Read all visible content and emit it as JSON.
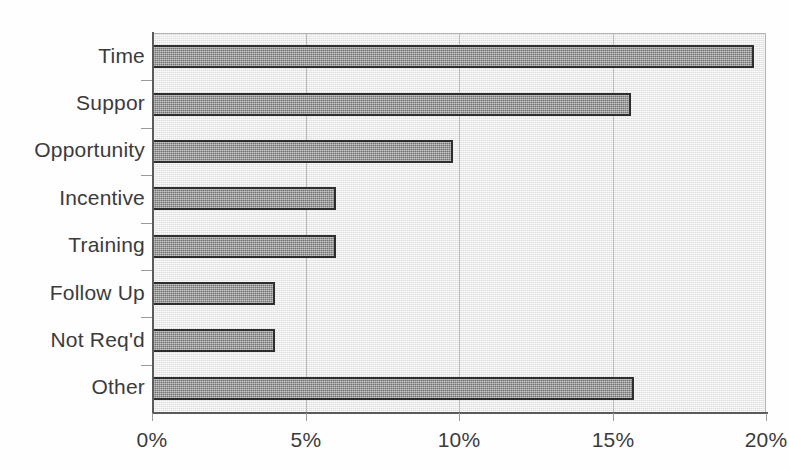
{
  "chart_data": {
    "type": "bar",
    "orientation": "horizontal",
    "title": "",
    "subtitle": "",
    "xlabel": "",
    "ylabel": "",
    "categories": [
      "Time",
      "Suppor",
      "Opportunity",
      "Incentive",
      "Training",
      "Follow Up",
      "Not Req'd",
      "Other"
    ],
    "values": [
      19.6,
      15.6,
      9.8,
      6.0,
      6.0,
      4.0,
      4.0,
      15.7
    ],
    "value_suffix": "%",
    "xlim": [
      0,
      20
    ],
    "xticks": [
      0,
      5,
      10,
      15,
      20
    ],
    "xtick_labels": [
      "0%",
      "5%",
      "10%",
      "15%",
      "20%"
    ],
    "grid": true,
    "grid_axis": "x",
    "legend": false,
    "legend_position": "none",
    "colors": {
      "bar_fill": "#8e8e8e",
      "bar_border": "#2e2e2e",
      "plot_background": "#ededed",
      "gridline": "#b9b9b9",
      "axis": "#5b5b5b",
      "text": "#3b3b3b",
      "page_background": "#fefefe"
    }
  }
}
